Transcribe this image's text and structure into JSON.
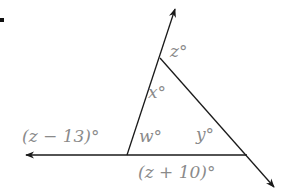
{
  "problem": {
    "bullet": "■"
  },
  "diagram": {
    "type": "triangle-exterior-angles",
    "line_color": "#1a1a1a",
    "label_color": "#8a8a8a",
    "labels": {
      "z": "z°",
      "x": "x°",
      "w": "w°",
      "y": "y°",
      "left_exterior": "(z − 13)°",
      "bottom_exterior": "(z + 10)°"
    },
    "vertices": {
      "top": [
        160,
        58
      ],
      "bottom_left": [
        127,
        155
      ],
      "bottom_right": [
        247,
        155
      ]
    }
  }
}
